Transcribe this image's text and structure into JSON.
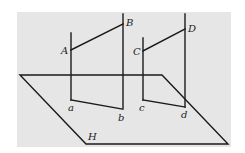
{
  "diagram": {
    "type": "geometry-projection",
    "background_color": "#e6e6e6",
    "stroke_color": "#1a1a1a",
    "plane": {
      "label": "H",
      "vertices": [
        [
          20,
          75
        ],
        [
          162,
          75
        ],
        [
          228,
          144
        ],
        [
          86,
          144
        ]
      ]
    },
    "segments": [
      {
        "from_label": "A",
        "to_label": "B",
        "A": [
          71,
          50
        ],
        "B": [
          123,
          24
        ]
      },
      {
        "from_label": "C",
        "to_label": "D",
        "C": [
          143,
          51
        ],
        "D": [
          185,
          29
        ]
      },
      {
        "from_label": "a",
        "to_label": "b",
        "a": [
          71,
          100
        ],
        "b": [
          122,
          109
        ]
      },
      {
        "from_label": "c",
        "to_label": "d",
        "c": [
          143,
          100
        ],
        "d": [
          185,
          107
        ]
      }
    ],
    "verticals": [
      {
        "x": 71,
        "y1": 33,
        "y2": 100
      },
      {
        "x": 123,
        "y1": 14,
        "y2": 109
      },
      {
        "x": 143,
        "y1": 38,
        "y2": 100
      },
      {
        "x": 185,
        "y1": 14,
        "y2": 107
      }
    ],
    "labels": {
      "A": "A",
      "B": "B",
      "C": "C",
      "D": "D",
      "a": "a",
      "b": "b",
      "c": "c",
      "d": "d",
      "H": "H"
    }
  }
}
